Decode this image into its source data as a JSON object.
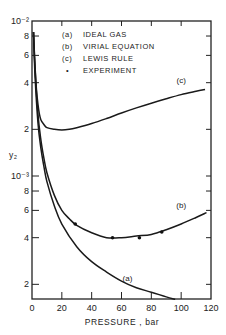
{
  "chart_data": {
    "type": "line",
    "title": "",
    "xlabel": "PRESSURE , bar",
    "ylabel": "y₂",
    "xscale": "linear",
    "yscale": "log",
    "xlim": [
      0,
      120
    ],
    "ylim": [
      0.00016,
      0.01
    ],
    "grid": false,
    "legend_placement": "top-left",
    "x_ticks": [
      0,
      20,
      40,
      60,
      80,
      100,
      120
    ],
    "x_tick_labels": [
      "0",
      "20",
      "40",
      "60",
      "80",
      "100",
      "120"
    ],
    "y_ticks": [
      {
        "value": 0.01,
        "label": "10⁻²"
      },
      {
        "value": 0.008,
        "label": "8"
      },
      {
        "value": 0.006,
        "label": "6"
      },
      {
        "value": 0.004,
        "label": "4"
      },
      {
        "value": 0.002,
        "label": "2"
      },
      {
        "value": 0.001,
        "label": "10⁻³"
      },
      {
        "value": 0.0008,
        "label": "8"
      },
      {
        "value": 0.0006,
        "label": "6"
      },
      {
        "value": 0.0004,
        "label": "4"
      },
      {
        "value": 0.0002,
        "label": "2"
      }
    ],
    "legend": [
      {
        "key": "(a)",
        "label": "IDEAL GAS"
      },
      {
        "key": "(b)",
        "label": "VIRIAL EQUATION"
      },
      {
        "key": "(c)",
        "label": "LEWIS RULE"
      },
      {
        "key": "•",
        "label": "EXPERIMENT"
      }
    ],
    "series": [
      {
        "name": "(a) ideal gas",
        "label": "(a)",
        "x": [
          1,
          2,
          4,
          6,
          8,
          10,
          15,
          20,
          30,
          40,
          50,
          60,
          70,
          80,
          90,
          96
        ],
        "y": [
          0.0085,
          0.0045,
          0.0022,
          0.0015,
          0.00115,
          0.00092,
          0.00064,
          0.00049,
          0.00035,
          0.00028,
          0.00024,
          0.00021,
          0.00019,
          0.000178,
          0.000166,
          0.00016
        ]
      },
      {
        "name": "(b) virial equation",
        "label": "(b)",
        "x": [
          1,
          2,
          4,
          6,
          8,
          10,
          15,
          20,
          25,
          30,
          40,
          50,
          60,
          70,
          80,
          90,
          100,
          110,
          117
        ],
        "y": [
          0.0085,
          0.005,
          0.0025,
          0.0017,
          0.0013,
          0.00105,
          0.00075,
          0.0006,
          0.00053,
          0.00048,
          0.00043,
          0.0004,
          0.0004,
          0.00041,
          0.00042,
          0.00045,
          0.00049,
          0.00054,
          0.00058
        ]
      },
      {
        "name": "(c) Lewis rule",
        "label": "(c)",
        "x": [
          1,
          2,
          3,
          4,
          5,
          6,
          8,
          10,
          15,
          20,
          25,
          30,
          40,
          50,
          60,
          70,
          80,
          90,
          100,
          110,
          116
        ],
        "y": [
          0.0085,
          0.0052,
          0.0036,
          0.0029,
          0.0025,
          0.0023,
          0.00215,
          0.00205,
          0.002,
          0.00198,
          0.002,
          0.00205,
          0.00218,
          0.00235,
          0.00255,
          0.00275,
          0.00295,
          0.00315,
          0.00335,
          0.00352,
          0.00362
        ]
      },
      {
        "name": "experiment",
        "type": "scatter",
        "x": [
          29,
          54,
          72,
          87
        ],
        "y": [
          0.00049,
          0.0004,
          0.0004,
          0.000435
        ]
      }
    ]
  }
}
